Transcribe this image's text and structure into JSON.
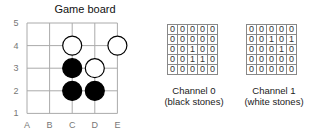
{
  "title": "Game board",
  "board": {
    "columns": [
      "A",
      "B",
      "C",
      "D",
      "E"
    ],
    "rows": [
      "5",
      "4",
      "3",
      "2",
      "1"
    ],
    "stones": [
      {
        "col": "C",
        "row": "4",
        "color": "white"
      },
      {
        "col": "E",
        "row": "4",
        "color": "white"
      },
      {
        "col": "C",
        "row": "3",
        "color": "black"
      },
      {
        "col": "D",
        "row": "3",
        "color": "white"
      },
      {
        "col": "C",
        "row": "2",
        "color": "black"
      },
      {
        "col": "D",
        "row": "2",
        "color": "black"
      }
    ]
  },
  "channels": [
    {
      "label": "Channel 0",
      "sublabel": "(black stones)",
      "matrix": [
        [
          "0",
          "0",
          "0",
          "0",
          "0"
        ],
        [
          "0",
          "0",
          "0",
          "0",
          "0"
        ],
        [
          "0",
          "0",
          "1",
          "0",
          "0"
        ],
        [
          "0",
          "0",
          "1",
          "1",
          "0"
        ],
        [
          "0",
          "0",
          "0",
          "0",
          "0"
        ]
      ]
    },
    {
      "label": "Channel 1",
      "sublabel": "(white stones)",
      "matrix": [
        [
          "0",
          "0",
          "0",
          "0",
          "0"
        ],
        [
          "0",
          "0",
          "1",
          "0",
          "1"
        ],
        [
          "0",
          "0",
          "0",
          "1",
          "0"
        ],
        [
          "0",
          "0",
          "0",
          "0",
          "0"
        ],
        [
          "0",
          "0",
          "0",
          "0",
          "0"
        ]
      ]
    }
  ]
}
